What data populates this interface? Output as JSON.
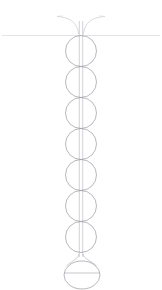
{
  "canvas": {
    "width": 162,
    "height": 290,
    "background": "#ffffff",
    "title": "vertical bead-chain apparatus line drawing"
  },
  "style": {
    "stroke_color": "#9a9aa2",
    "stroke_color_faint": "#c9c9d0",
    "stroke_color_stem": "#b4b4bc",
    "stroke_width": 0.7,
    "stroke_width_faint": 0.55
  },
  "chart_data": {
    "type": "scatter",
    "title": "",
    "xlabel": "",
    "ylabel": "",
    "xlim": [
      0,
      162
    ],
    "ylim": [
      0,
      290
    ],
    "grid": false,
    "legend": false,
    "categories": [
      "bead-1",
      "bead-2",
      "bead-3",
      "bead-4",
      "bead-5",
      "bead-6",
      "bead-7",
      "terminal-bulb"
    ],
    "values": [
      31,
      31,
      31,
      31,
      31,
      31,
      31,
      26
    ],
    "x": [
      81,
      81,
      81,
      81,
      81,
      81,
      81,
      82
    ],
    "series": [
      {
        "name": "bead-center-y",
        "values": [
          51,
          82,
          113,
          144,
          175,
          206,
          237,
          275
        ]
      },
      {
        "name": "bead-radius",
        "values": [
          15.5,
          15.5,
          15.5,
          15.5,
          15.5,
          15.5,
          15.5,
          18
        ]
      }
    ]
  },
  "geometry": {
    "axis_x": 81,
    "stem": {
      "left_x": 79.3,
      "right_x": 82.7,
      "top_y": 20,
      "bottom_y": 258
    },
    "funnel": {
      "left_tip_x": 57,
      "right_tip_x": 105,
      "rim_y": 16,
      "throat_y": 34,
      "throat_half_width": 2.6
    },
    "reference_line": {
      "x1": 2,
      "x2": 160,
      "y": 35.5
    },
    "beads": [
      {
        "cx": 81,
        "cy": 51,
        "r": 15.5
      },
      {
        "cx": 81,
        "cy": 82,
        "r": 15.5
      },
      {
        "cx": 81,
        "cy": 113,
        "r": 15.5
      },
      {
        "cx": 81,
        "cy": 144,
        "r": 15.5
      },
      {
        "cx": 81,
        "cy": 175,
        "r": 15.5
      },
      {
        "cx": 81,
        "cy": 206,
        "r": 15.5
      },
      {
        "cx": 81,
        "cy": 237,
        "r": 15.5
      }
    ],
    "bulb": {
      "cx": 82,
      "cy": 275,
      "rx": 18,
      "ry": 14,
      "neck_y": 256,
      "neck_half_width": 3.2,
      "shoulder_y": 263,
      "equator_y": 273,
      "equator_x1": 64,
      "equator_x2": 100
    }
  },
  "labels": {
    "funnel": "funnel",
    "reference_line": "horizontal reference line",
    "stem": "double-line stem",
    "beads": "bead chain",
    "bulb": "terminal bulb",
    "equator": "bulb equator line"
  }
}
